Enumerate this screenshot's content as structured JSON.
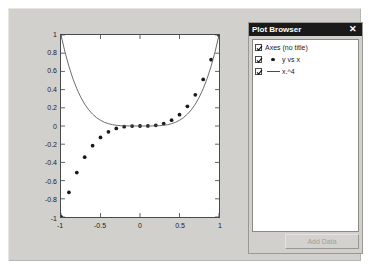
{
  "window": {
    "background": "#d2d0cc"
  },
  "browser": {
    "title": "Plot Browser",
    "close_label": "✕",
    "items": [
      {
        "label": "Axes (no title)",
        "checked": true,
        "icon": "none"
      },
      {
        "label": "y vs x",
        "checked": true,
        "icon": "marker-dot"
      },
      {
        "label": "x.^4",
        "checked": true,
        "icon": "line-swatch"
      }
    ],
    "add_data_label": "Add Data",
    "add_data_enabled": false
  },
  "axes": {
    "x_ticks": [
      "-1",
      "-0.5",
      "0",
      "0.5",
      "1"
    ],
    "y_ticks": [
      "1",
      "0.8",
      "0.6",
      "0.4",
      "0.2",
      "0",
      "-0.2",
      "-0.4",
      "-0.6",
      "-0.8",
      "-1"
    ]
  },
  "chart_data": {
    "type": "scatter",
    "title": "",
    "xlabel": "",
    "ylabel": "",
    "xlim": [
      -1,
      1
    ],
    "ylim": [
      -1,
      1
    ],
    "grid": false,
    "legend_position": "none",
    "x_ticks": [
      -1,
      -0.5,
      0,
      0.5,
      1
    ],
    "y_ticks": [
      1,
      0.8,
      0.6,
      0.4,
      0.2,
      0,
      -0.2,
      -0.4,
      -0.6,
      -0.8,
      -1
    ],
    "series": [
      {
        "name": "y vs x",
        "type": "scatter",
        "marker": "circle",
        "color": "#1a1a1a",
        "x": [
          -1.0,
          -0.9,
          -0.8,
          -0.7,
          -0.6,
          -0.5,
          -0.4,
          -0.3,
          -0.2,
          -0.1,
          0.0,
          0.1,
          0.2,
          0.3,
          0.4,
          0.5,
          0.6,
          0.7,
          0.8,
          0.9,
          1.0
        ],
        "values": [
          -1.0,
          -0.729,
          -0.512,
          -0.343,
          -0.216,
          -0.125,
          -0.064,
          -0.027,
          -0.008,
          -0.001,
          0.0,
          0.001,
          0.008,
          0.027,
          0.064,
          0.125,
          0.216,
          0.343,
          0.512,
          0.729,
          1.0
        ]
      },
      {
        "name": "x.^4",
        "type": "line",
        "color": "#5a5a5a",
        "x": [
          -1.0,
          -0.95,
          -0.9,
          -0.85,
          -0.8,
          -0.75,
          -0.7,
          -0.65,
          -0.6,
          -0.55,
          -0.5,
          -0.45,
          -0.4,
          -0.35,
          -0.3,
          -0.25,
          -0.2,
          -0.15,
          -0.1,
          -0.05,
          0.0,
          0.05,
          0.1,
          0.15,
          0.2,
          0.25,
          0.3,
          0.35,
          0.4,
          0.45,
          0.5,
          0.55,
          0.6,
          0.65,
          0.7,
          0.75,
          0.8,
          0.85,
          0.9,
          0.95,
          1.0
        ],
        "values": [
          1.0,
          0.8145,
          0.6561,
          0.522,
          0.4096,
          0.3164,
          0.2401,
          0.1785,
          0.1296,
          0.0915,
          0.0625,
          0.041,
          0.0256,
          0.015,
          0.0081,
          0.0039,
          0.0016,
          0.0005,
          0.0001,
          0.0,
          0.0,
          0.0,
          0.0001,
          0.0005,
          0.0016,
          0.0039,
          0.0081,
          0.015,
          0.0256,
          0.041,
          0.0625,
          0.0915,
          0.1296,
          0.1785,
          0.2401,
          0.3164,
          0.4096,
          0.522,
          0.6561,
          0.8145,
          1.0
        ]
      }
    ]
  }
}
